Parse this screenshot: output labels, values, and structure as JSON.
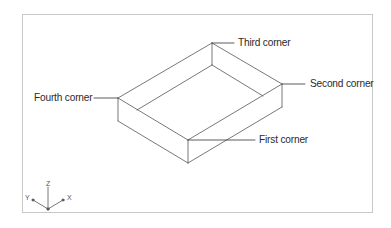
{
  "diagram": {
    "type": "isometric-box",
    "labels": {
      "first_corner": "First corner",
      "second_corner": "Second corner",
      "third_corner": "Third corner",
      "fourth_corner": "Fourth corner"
    },
    "ucs_icon": {
      "x_label": "X",
      "y_label": "Y",
      "z_label": "Z"
    },
    "colors": {
      "line": "#555555",
      "frame": "#c8c8c8",
      "text": "#2a2a2a",
      "background": "#ffffff"
    }
  }
}
